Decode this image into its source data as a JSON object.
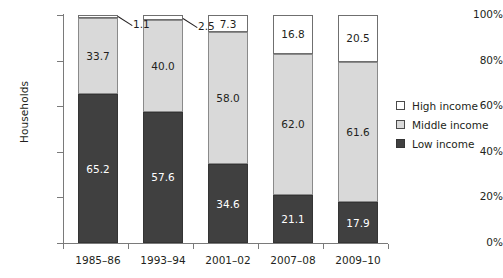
{
  "chart_data": {
    "type": "bar",
    "subtype": "100% stacked bar",
    "title": "",
    "xlabel": "",
    "ylabel": "Households",
    "ylim": [
      0,
      100
    ],
    "yticks": [
      "0%",
      "20%",
      "40%",
      "60%",
      "80%",
      "100%"
    ],
    "grid": false,
    "legend_position": "right",
    "categories": [
      "1985–86",
      "1993–94",
      "2001–02",
      "2007–08",
      "2009–10"
    ],
    "series": [
      {
        "name": "Low income",
        "values": [
          65.2,
          57.6,
          34.6,
          21.1,
          17.9
        ]
      },
      {
        "name": "Middle income",
        "values": [
          33.7,
          40.0,
          58.0,
          62.0,
          61.6
        ]
      },
      {
        "name": "High income",
        "values": [
          1.1,
          2.5,
          7.3,
          16.8,
          20.5
        ]
      }
    ],
    "annotations": [
      {
        "text": "1.1",
        "series": "High income",
        "category": "1985–86",
        "style": "leader-line"
      },
      {
        "text": "2.5",
        "series": "High income",
        "category": "1993–94",
        "style": "leader-line"
      }
    ]
  },
  "axes": {
    "y_title": "Households",
    "y_ticks": [
      {
        "label": "100%",
        "value": 100
      },
      {
        "label": "80%",
        "value": 80
      },
      {
        "label": "60%",
        "value": 60
      },
      {
        "label": "40%",
        "value": 40
      },
      {
        "label": "20%",
        "value": 20
      },
      {
        "label": "0%",
        "value": 0
      }
    ],
    "x_ticks": [
      {
        "label": "1985–86"
      },
      {
        "label": "1993–94"
      },
      {
        "label": "2001–02"
      },
      {
        "label": "2007–08"
      },
      {
        "label": "2009–10"
      }
    ]
  },
  "legend": {
    "items": [
      {
        "label": "High income",
        "color": "#ffffff",
        "swatch": "high"
      },
      {
        "label": "Middle income",
        "color": "#d9d9d9",
        "swatch": "middle"
      },
      {
        "label": "Low income",
        "color": "#404040",
        "swatch": "low"
      }
    ]
  },
  "colors": {
    "low_income": "#404040",
    "middle_income": "#d9d9d9",
    "high_income": "#ffffff",
    "axis": "#7a7a7a",
    "text": "#231f20"
  }
}
